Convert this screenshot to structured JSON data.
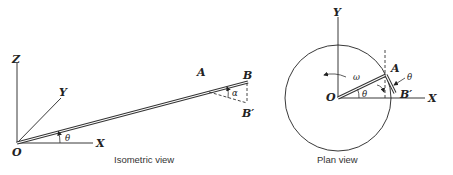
{
  "isometric_view": {
    "caption": "Isometric view",
    "axes": {
      "z": "Z",
      "y": "Y",
      "x": "X",
      "origin": "O"
    },
    "points": {
      "a": "A",
      "b": "B",
      "b_prime": "B′"
    },
    "angles": {
      "theta": "θ",
      "alpha": "α"
    }
  },
  "plan_view": {
    "caption": "Plan view",
    "axes": {
      "y": "Y",
      "x": "X",
      "origin": "O"
    },
    "points": {
      "a": "A",
      "b_prime": "B′"
    },
    "angles": {
      "theta": "θ",
      "theta_arm": "θ",
      "omega": "ω"
    }
  },
  "colors": {
    "line": "#222222",
    "background": "#ffffff"
  }
}
